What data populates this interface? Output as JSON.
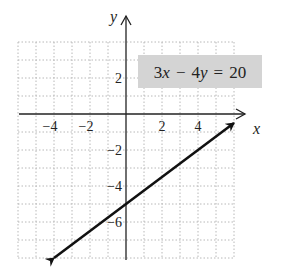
{
  "chart_data": {
    "type": "line",
    "title": "",
    "equation": "3x − 4y = 20",
    "equation_parts": {
      "a": "3",
      "x": "x",
      "op": "−",
      "b": "4",
      "y": "y",
      "eq": "=",
      "rhs": "20"
    },
    "xlabel": "x",
    "ylabel": "y",
    "xlim": [
      -6,
      6
    ],
    "ylim": [
      -8,
      4
    ],
    "grid": true,
    "x_ticks": [
      {
        "value": -4,
        "label": "−4"
      },
      {
        "value": -2,
        "label": "−2"
      },
      {
        "value": 2,
        "label": "2"
      },
      {
        "value": 4,
        "label": "4"
      }
    ],
    "y_ticks": [
      {
        "value": 2,
        "label": "2"
      },
      {
        "value": -2,
        "label": "−2"
      },
      {
        "value": -4,
        "label": "−4"
      },
      {
        "value": -6,
        "label": "−6"
      }
    ],
    "series": [
      {
        "name": "3x − 4y = 20",
        "x": [
          -4,
          0,
          6
        ],
        "y": [
          -8,
          -5,
          -0.5
        ],
        "arrows_both_ends": true
      }
    ],
    "colors": {
      "line": "#111111",
      "grid": "#b8b8b8",
      "label_box": "#d4d4d4"
    }
  }
}
